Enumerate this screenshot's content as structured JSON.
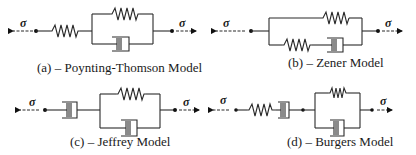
{
  "figure": {
    "models": [
      {
        "id": "a",
        "caption": "(a) – Poynting-Thomson Model",
        "sigma_left": "σ",
        "sigma_right": "σ",
        "elements": [
          "spring in series with (spring parallel dashpot)"
        ]
      },
      {
        "id": "b",
        "caption": "(b) – Zener Model",
        "sigma_left": "σ",
        "sigma_right": "σ",
        "elements": [
          "spring parallel (spring in series with dashpot)"
        ]
      },
      {
        "id": "c",
        "caption": "(c) – Jeffrey Model",
        "sigma_left": "σ",
        "sigma_right": "σ",
        "elements": [
          "dashpot in series with (spring parallel dashpot)"
        ]
      },
      {
        "id": "d",
        "caption": "(d) – Burgers Model",
        "sigma_left": "σ",
        "sigma_right": "σ",
        "elements": [
          "spring in series with dashpot in series with (spring parallel dashpot)"
        ]
      }
    ],
    "colors": {
      "line": "#2a2a2a",
      "text": "#1a1a1a",
      "background": "#ffffff"
    }
  }
}
